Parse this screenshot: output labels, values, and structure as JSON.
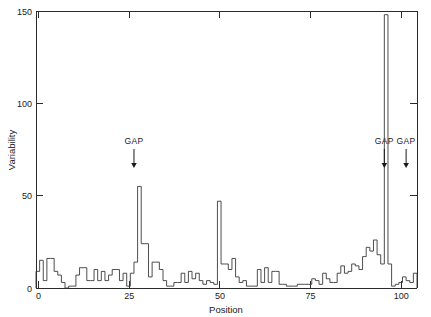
{
  "chart_data": {
    "type": "line",
    "title": "",
    "subtitle": "",
    "xlabel": "Position",
    "ylabel": "Variability",
    "xlim": [
      0,
      105
    ],
    "ylim": [
      0,
      150
    ],
    "xticks": [
      0,
      25,
      50,
      75,
      100
    ],
    "xticklabels": [
      "0",
      "25",
      "50",
      "75",
      "100"
    ],
    "yticks": [
      0,
      50,
      100,
      150
    ],
    "yticklabels": [
      "0",
      "50",
      "100",
      "150"
    ],
    "grid": false,
    "legend": null,
    "style": "step",
    "annotations": [
      {
        "label": "GAP",
        "x": 27,
        "y": 78,
        "arrow": "down"
      },
      {
        "label": "GAP",
        "x": 96,
        "y": 78,
        "arrow": "down"
      },
      {
        "label": "GAP",
        "x": 102,
        "y": 78,
        "arrow": "down"
      }
    ],
    "x": [
      0,
      1,
      2,
      3,
      4,
      5,
      6,
      7,
      8,
      9,
      10,
      11,
      12,
      13,
      14,
      15,
      16,
      17,
      18,
      19,
      20,
      21,
      22,
      23,
      24,
      25,
      26,
      27,
      28,
      29,
      30,
      31,
      32,
      33,
      34,
      35,
      36,
      37,
      38,
      39,
      40,
      41,
      42,
      43,
      44,
      45,
      46,
      47,
      48,
      49,
      50,
      51,
      52,
      53,
      54,
      55,
      56,
      57,
      58,
      59,
      60,
      61,
      62,
      63,
      64,
      65,
      66,
      67,
      68,
      69,
      70,
      71,
      72,
      73,
      74,
      75,
      76,
      77,
      78,
      79,
      80,
      81,
      82,
      83,
      84,
      85,
      86,
      87,
      88,
      89,
      90,
      91,
      92,
      93,
      94,
      95,
      96,
      97,
      98,
      99,
      100,
      101,
      102,
      103,
      104
    ],
    "values": [
      9,
      15,
      4,
      16,
      16,
      9,
      7,
      3,
      0,
      1,
      1,
      7,
      11,
      11,
      4,
      4,
      10,
      4,
      9,
      4,
      7,
      10,
      10,
      4,
      8,
      1,
      8,
      14,
      55,
      24,
      24,
      6,
      14,
      14,
      10,
      4,
      1,
      1,
      3,
      3,
      8,
      3,
      9,
      5,
      8,
      4,
      2,
      4,
      3,
      2,
      47,
      13,
      13,
      10,
      16,
      6,
      3,
      4,
      1,
      1,
      1,
      10,
      3,
      11,
      3,
      9,
      9,
      2,
      2,
      1,
      1,
      1,
      2,
      2,
      2,
      2,
      5,
      4,
      2,
      8,
      5,
      3,
      3,
      8,
      12,
      8,
      9,
      13,
      12,
      10,
      17,
      22,
      20,
      26,
      18,
      13,
      148,
      13,
      1,
      2,
      3,
      6,
      4,
      3,
      8
    ],
    "series": [
      {
        "name": "variability",
        "color": "#3a3a3a",
        "values": [
          9,
          15,
          4,
          16,
          16,
          9,
          7,
          3,
          0,
          1,
          1,
          7,
          11,
          11,
          4,
          4,
          10,
          4,
          9,
          4,
          7,
          10,
          10,
          4,
          8,
          1,
          8,
          14,
          55,
          24,
          24,
          6,
          14,
          14,
          10,
          4,
          1,
          1,
          3,
          3,
          8,
          3,
          9,
          5,
          8,
          4,
          2,
          4,
          3,
          2,
          47,
          13,
          13,
          10,
          16,
          6,
          3,
          4,
          1,
          1,
          1,
          10,
          3,
          11,
          3,
          9,
          9,
          2,
          2,
          1,
          1,
          1,
          2,
          2,
          2,
          2,
          5,
          4,
          2,
          8,
          5,
          3,
          3,
          8,
          12,
          8,
          9,
          13,
          12,
          10,
          17,
          22,
          20,
          26,
          18,
          13,
          148,
          13,
          1,
          2,
          3,
          6,
          4,
          3,
          8
        ]
      }
    ],
    "peaks": [
      {
        "position": 28,
        "value": 55
      },
      {
        "position": 50,
        "value": 47
      },
      {
        "position": 96,
        "value": 148
      }
    ]
  },
  "axes": {
    "x_label": "Position",
    "y_label": "Variability"
  },
  "colors": {
    "line": "#3a3a3a",
    "axis": "#2b2b2b",
    "text": "#1a1a1a",
    "background": "#ffffff"
  }
}
